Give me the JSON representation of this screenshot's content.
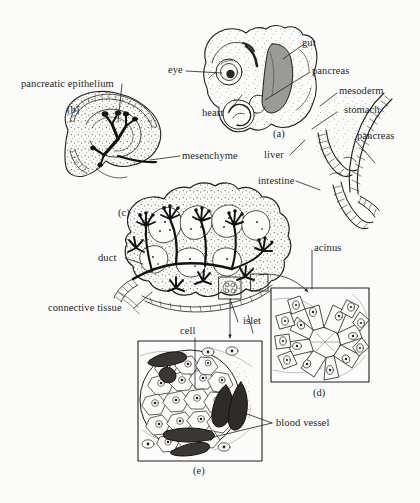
{
  "figure": {
    "background_color": "#fbfbfa",
    "ink_color": "#231f1e",
    "shade_color": "#9a9a98"
  },
  "panels": [
    {
      "id": "a",
      "letter": "(a)",
      "caption": "embryo with gut and pancreas"
    },
    {
      "id": "b",
      "letter": "(b)",
      "caption": "pancreatic bud epithelium in mesenchyme"
    },
    {
      "id": "c",
      "letter": "(c)",
      "caption": "branched pancreas with ducts and acini"
    },
    {
      "id": "d",
      "letter": "(d)",
      "caption": "acinus detail"
    },
    {
      "id": "e",
      "letter": "(e)",
      "caption": "islet detail"
    }
  ],
  "labels": [
    {
      "key": "gut",
      "text": "gut"
    },
    {
      "key": "pancreas_embryo",
      "text": "pancreas"
    },
    {
      "key": "eye",
      "text": "eye"
    },
    {
      "key": "heart",
      "text": "heart"
    },
    {
      "key": "mesoderm",
      "text": "mesoderm"
    },
    {
      "key": "stomach",
      "text": "stomach"
    },
    {
      "key": "pancreas_gut",
      "text": "pancreas"
    },
    {
      "key": "liver",
      "text": "liver"
    },
    {
      "key": "intestine",
      "text": "intestine"
    },
    {
      "key": "pancreatic_epithelium",
      "text": "pancreatic epithelium"
    },
    {
      "key": "mesenchyme",
      "text": "mesenchyme"
    },
    {
      "key": "duct",
      "text": "duct"
    },
    {
      "key": "connective_tissue",
      "text": "connective tissue"
    },
    {
      "key": "acinus",
      "text": "acinus"
    },
    {
      "key": "islet",
      "text": "islet"
    },
    {
      "key": "cell",
      "text": "cell"
    },
    {
      "key": "blood_vessel",
      "text": "blood vessel"
    }
  ]
}
